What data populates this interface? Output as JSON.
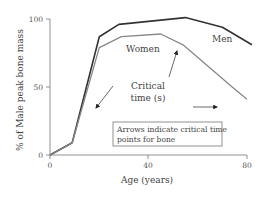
{
  "chart_data": {
    "type": "line",
    "title": "",
    "xlabel": "Age (years)",
    "ylabel": "% of Male peak bone mass",
    "xlim": [
      0,
      80
    ],
    "ylim": [
      0,
      100
    ],
    "x_ticks": [
      "0",
      "40",
      "80"
    ],
    "y_ticks": [
      "0",
      "50",
      "100"
    ],
    "grid": false,
    "legend": "inline labels",
    "series": [
      {
        "name": "Men",
        "color": "#333333",
        "points": [
          [
            0,
            0
          ],
          [
            9,
            9
          ],
          [
            20,
            87
          ],
          [
            28,
            96
          ],
          [
            55,
            101
          ],
          [
            70,
            94
          ],
          [
            82,
            81
          ]
        ]
      },
      {
        "name": "Women",
        "color": "#888888",
        "points": [
          [
            0,
            0
          ],
          [
            9,
            9
          ],
          [
            20,
            79
          ],
          [
            29,
            87
          ],
          [
            45,
            89
          ],
          [
            54,
            81
          ],
          [
            74,
            50
          ],
          [
            80,
            41
          ]
        ]
      }
    ],
    "annotations": [
      {
        "text": "Critical time (s)",
        "type": "label"
      },
      {
        "text": "Arrows indicate critical time points for bone",
        "type": "boxed-note"
      },
      {
        "type": "arrow",
        "direction": "down-left",
        "note": "critical time during growth"
      },
      {
        "type": "arrow",
        "direction": "up",
        "note": "critical time at menopause"
      },
      {
        "type": "arrow",
        "direction": "right",
        "note": "critical time in old age"
      }
    ]
  },
  "labels": {
    "men": "Men",
    "women": "Women",
    "critical_line1": "Critical",
    "critical_line2": "time (s)",
    "note_line1": "Arrows indicate critical time",
    "note_line2": "points for bone",
    "xlabel": "Age (years)",
    "ylabel": "% of Male peak bone mass",
    "xtick_0": "0",
    "xtick_40": "40",
    "xtick_80": "80",
    "ytick_0": "0",
    "ytick_50": "50",
    "ytick_100": "100"
  }
}
